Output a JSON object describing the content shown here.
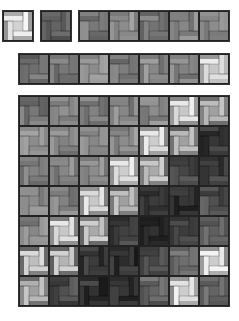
{
  "tile_size": 30,
  "pattern": "pinwheel",
  "panels": [
    {
      "name": "single-tile-a",
      "x": 3,
      "y": 11,
      "cols": 1,
      "rows": 1,
      "tiles": [
        [
          {
            "b": 170,
            "c": 250
          }
        ]
      ]
    },
    {
      "name": "single-tile-b",
      "x": 41,
      "y": 11,
      "cols": 1,
      "rows": 1,
      "tiles": [
        [
          {
            "b": 100,
            "c": 90
          }
        ]
      ]
    },
    {
      "name": "strip-5",
      "x": 79,
      "y": 11,
      "cols": 5,
      "rows": 1,
      "tiles": [
        [
          {
            "b": 120,
            "c": 110
          },
          {
            "b": 140,
            "c": 130
          },
          {
            "b": 115,
            "c": 100
          },
          {
            "b": 135,
            "c": 125
          },
          {
            "b": 140,
            "c": 150
          }
        ]
      ]
    },
    {
      "name": "strip-7",
      "x": 19,
      "y": 54,
      "cols": 7,
      "rows": 1,
      "tiles": [
        [
          {
            "b": 110,
            "c": 100
          },
          {
            "b": 120,
            "c": 110
          },
          {
            "b": 140,
            "c": 130
          },
          {
            "b": 125,
            "c": 115
          },
          {
            "b": 135,
            "c": 125
          },
          {
            "b": 130,
            "c": 120
          },
          {
            "b": 175,
            "c": 240
          }
        ]
      ]
    },
    {
      "name": "grid-7x7",
      "x": 19,
      "y": 96,
      "cols": 7,
      "rows": 7,
      "tiles": [
        [
          {
            "b": 120,
            "c": 110
          },
          {
            "b": 145,
            "c": 135
          },
          {
            "b": 130,
            "c": 120
          },
          {
            "b": 135,
            "c": 125
          },
          {
            "b": 140,
            "c": 130
          },
          {
            "b": 150,
            "c": 240
          },
          {
            "b": 110,
            "c": 200
          }
        ],
        [
          {
            "b": 140,
            "c": 130
          },
          {
            "b": 130,
            "c": 120
          },
          {
            "b": 135,
            "c": 125
          },
          {
            "b": 140,
            "c": 130
          },
          {
            "b": 160,
            "c": 245
          },
          {
            "b": 110,
            "c": 200
          },
          {
            "b": 55,
            "c": 45
          }
        ],
        [
          {
            "b": 130,
            "c": 120
          },
          {
            "b": 135,
            "c": 125
          },
          {
            "b": 140,
            "c": 130
          },
          {
            "b": 150,
            "c": 245
          },
          {
            "b": 120,
            "c": 210
          },
          {
            "b": 70,
            "c": 60
          },
          {
            "b": 60,
            "c": 50
          }
        ],
        [
          {
            "b": 140,
            "c": 130
          },
          {
            "b": 130,
            "c": 120
          },
          {
            "b": 150,
            "c": 240
          },
          {
            "b": 120,
            "c": 200
          },
          {
            "b": 60,
            "c": 50
          },
          {
            "b": 55,
            "c": 45
          },
          {
            "b": 80,
            "c": 90
          }
        ],
        [
          {
            "b": 135,
            "c": 125
          },
          {
            "b": 150,
            "c": 240
          },
          {
            "b": 120,
            "c": 210
          },
          {
            "b": 65,
            "c": 55
          },
          {
            "b": 50,
            "c": 40
          },
          {
            "b": 60,
            "c": 50
          },
          {
            "b": 95,
            "c": 85
          }
        ],
        [
          {
            "b": 120,
            "c": 230
          },
          {
            "b": 120,
            "c": 220
          },
          {
            "b": 60,
            "c": 50
          },
          {
            "b": 45,
            "c": 40
          },
          {
            "b": 70,
            "c": 60
          },
          {
            "b": 110,
            "c": 100
          },
          {
            "b": 150,
            "c": 245
          }
        ],
        [
          {
            "b": 120,
            "c": 200
          },
          {
            "b": 80,
            "c": 70
          },
          {
            "b": 50,
            "c": 40
          },
          {
            "b": 55,
            "c": 45
          },
          {
            "b": 100,
            "c": 90
          },
          {
            "b": 150,
            "c": 245
          },
          {
            "b": 100,
            "c": 90
          }
        ]
      ]
    }
  ]
}
